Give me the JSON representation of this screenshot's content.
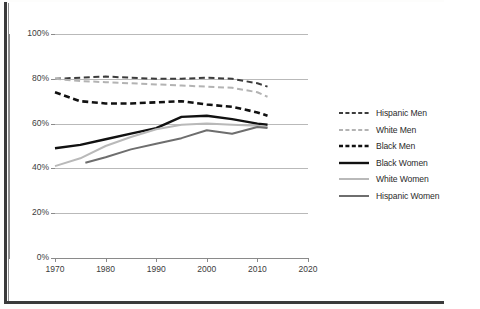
{
  "chart_data": {
    "type": "line",
    "title": "",
    "xlabel": "",
    "ylabel": "",
    "xlim": [
      1970,
      2020
    ],
    "ylim": [
      0,
      100
    ],
    "grid": true,
    "legend_position": "right",
    "x_ticks": [
      "1970",
      "1980",
      "1990",
      "2000",
      "2010",
      "2020"
    ],
    "y_ticks": [
      "0%",
      "20%",
      "40%",
      "60%",
      "80%",
      "100%"
    ],
    "series": [
      {
        "name": "Hispanic Men",
        "style": "dashed",
        "color": "#3c3c3c",
        "width": 2.0,
        "x": [
          1970,
          1975,
          1980,
          1985,
          1990,
          1995,
          2000,
          2005,
          2010,
          2012
        ],
        "values": [
          80,
          80.5,
          81,
          80.5,
          80,
          80,
          80.5,
          80,
          78,
          76.5
        ]
      },
      {
        "name": "White Men",
        "style": "dashed",
        "color": "#b3b3b3",
        "width": 2.0,
        "x": [
          1970,
          1975,
          1980,
          1985,
          1990,
          1995,
          2000,
          2005,
          2010,
          2012
        ],
        "values": [
          80,
          79,
          78.5,
          78,
          77.5,
          77,
          76.5,
          76,
          74,
          72
        ]
      },
      {
        "name": "Black Men",
        "style": "dashed",
        "color": "#111111",
        "width": 2.6,
        "x": [
          1970,
          1975,
          1980,
          1985,
          1990,
          1995,
          2000,
          2005,
          2010,
          2012
        ],
        "values": [
          74,
          70,
          69,
          69,
          69.5,
          70,
          68.5,
          67.5,
          65,
          63.5
        ]
      },
      {
        "name": "Black Women",
        "style": "solid",
        "color": "#111111",
        "width": 2.4,
        "x": [
          1970,
          1975,
          1980,
          1985,
          1990,
          1995,
          2000,
          2005,
          2010,
          2012
        ],
        "values": [
          49,
          50.5,
          53,
          55.5,
          58,
          63,
          63.5,
          62,
          60,
          59.5
        ]
      },
      {
        "name": "White Women",
        "style": "solid",
        "color": "#b9b9b9",
        "width": 2.0,
        "x": [
          1970,
          1975,
          1980,
          1985,
          1990,
          1995,
          2000,
          2005,
          2010,
          2012
        ],
        "values": [
          41,
          44.5,
          50,
          54,
          57.5,
          59.5,
          60,
          59.5,
          59,
          58.5
        ]
      },
      {
        "name": "Hispanic Women",
        "style": "solid",
        "color": "#6e6e6e",
        "width": 2.0,
        "x": [
          1976,
          1980,
          1985,
          1990,
          1995,
          2000,
          2005,
          2010,
          2012
        ],
        "values": [
          42.5,
          45,
          48.5,
          51,
          53.5,
          57,
          55.5,
          58.5,
          58
        ]
      }
    ]
  },
  "legend": {
    "items": [
      {
        "label": "Hispanic Men"
      },
      {
        "label": "White Men"
      },
      {
        "label": "Black Men"
      },
      {
        "label": "Black Women"
      },
      {
        "label": "White Women"
      },
      {
        "label": "Hispanic Women"
      }
    ]
  },
  "gutter": {
    "text": "s\nh\nt\no\ns\na\nr\ns\na\nh\nf\nn\ns\ny\nt\nv\nh\na\n2"
  }
}
